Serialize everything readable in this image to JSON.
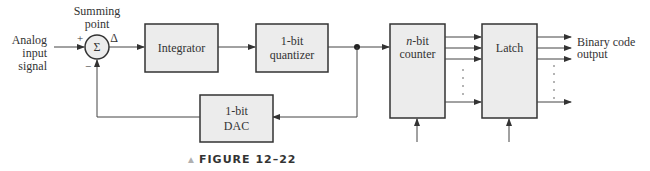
{
  "diagram": {
    "type": "block-diagram",
    "input": {
      "label_lines": [
        "Analog",
        "input",
        "signal"
      ]
    },
    "summing_point": {
      "caption_lines": [
        "Summing",
        "point"
      ],
      "symbol": "Σ",
      "plus": "+",
      "minus": "−",
      "delta": "Δ"
    },
    "blocks": {
      "integrator": {
        "lines": [
          "Integrator"
        ]
      },
      "quantizer": {
        "lines": [
          "1-bit",
          "quantizer"
        ]
      },
      "dac": {
        "lines": [
          "1-bit",
          "DAC"
        ]
      },
      "counter": {
        "lines_italic_prefix": "n",
        "lines": [
          "-bit",
          "counter"
        ]
      },
      "latch": {
        "lines": [
          "Latch"
        ]
      }
    },
    "output": {
      "label_lines": [
        "Binary code",
        "output"
      ]
    },
    "caption": {
      "marker": "▲",
      "text": "FIGURE 12–22"
    },
    "colors": {
      "block_fill": "#ececec",
      "line": "#444444",
      "caption_marker": "#b0b0b0"
    }
  }
}
